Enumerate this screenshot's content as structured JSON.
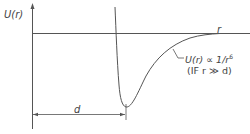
{
  "diagram": {
    "y_axis_label": "U(r)",
    "x_axis_label": "r",
    "dimension_label": "d",
    "annotation": {
      "line1": "U(r) ∝ 1/r",
      "line1_exponent": "6",
      "line2": "(IF r ≫ d)"
    },
    "colors": {
      "line": "#555555",
      "text": "#444444",
      "background": "#ffffff"
    }
  }
}
